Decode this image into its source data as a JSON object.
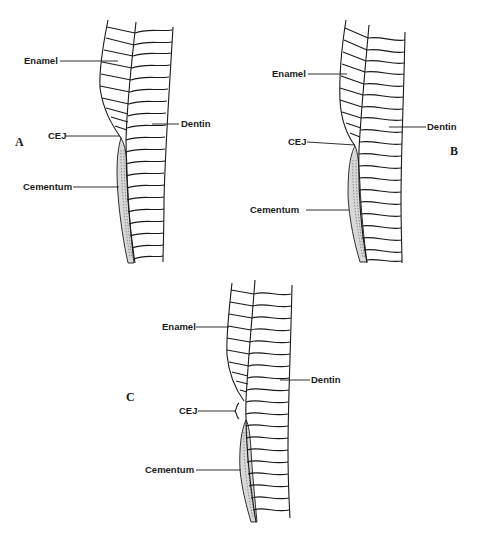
{
  "figure": {
    "panels": [
      {
        "id": "A",
        "panel_label": "A",
        "labels": {
          "enamel": "Enamel",
          "cej": "CEJ",
          "dentin": "Dentin",
          "cementum": "Cementum"
        },
        "relationship": "cementum meets enamel end-to-end"
      },
      {
        "id": "B",
        "panel_label": "B",
        "labels": {
          "enamel": "Enamel",
          "cej": "CEJ",
          "dentin": "Dentin",
          "cementum": "Cementum"
        },
        "relationship": "cementum overlaps enamel"
      },
      {
        "id": "C",
        "panel_label": "C",
        "labels": {
          "enamel": "Enamel",
          "cej": "CEJ",
          "dentin": "Dentin",
          "cementum": "Cementum"
        },
        "relationship": "gap between enamel and cementum"
      }
    ],
    "colors": {
      "ink": "#1a1a1a",
      "background": "#ffffff",
      "cementum_fill": "#d8d8d8"
    }
  }
}
